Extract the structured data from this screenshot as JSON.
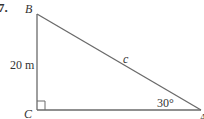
{
  "problem": {
    "number": "7."
  },
  "triangle": {
    "vertices": {
      "B": "B",
      "C": "C",
      "A": "A"
    },
    "side_BC": "20 m",
    "side_hypotenuse": "c",
    "angle_A": "30°",
    "right_angle_at": "C"
  },
  "colors": {
    "line": "#6a6a6a",
    "text": "#333333"
  }
}
